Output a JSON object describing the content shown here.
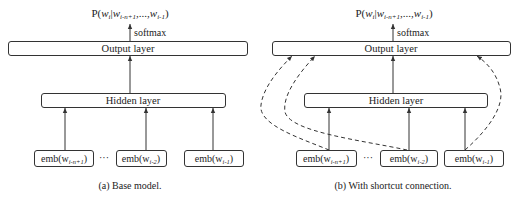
{
  "panels": [
    {
      "id": "a",
      "probability_label": "P(w",
      "prob": {
        "p": "P(",
        "wi": "w",
        "wi_sub": "i",
        "bar": "|",
        "w1": "w",
        "w1_sub": "i-n+1",
        "dots": ",...,",
        "w2": "w",
        "w2_sub": "i-1",
        "close": ")"
      },
      "softmax_label": "softmax",
      "output_layer_label": "Output layer",
      "hidden_layer_label": "Hidden layer",
      "embeddings": [
        {
          "prefix": "emb(w",
          "sub": "i-n+1",
          "suffix": ")"
        },
        {
          "prefix": "emb(w",
          "sub": "i-2",
          "suffix": ")"
        },
        {
          "prefix": "emb(w",
          "sub": "i-1",
          "suffix": ")"
        }
      ],
      "ellipsis": "···",
      "caption": "(a) Base model."
    },
    {
      "id": "b",
      "prob": {
        "p": "P(",
        "wi": "w",
        "wi_sub": "i",
        "bar": "|",
        "w1": "w",
        "w1_sub": "i-n+1",
        "dots": ",...,",
        "w2": "w",
        "w2_sub": "i-1",
        "close": ")"
      },
      "softmax_label": "softmax",
      "output_layer_label": "Output layer",
      "hidden_layer_label": "Hidden layer",
      "embeddings": [
        {
          "prefix": "emb(w",
          "sub": "i-n+1",
          "suffix": ")"
        },
        {
          "prefix": "emb(w",
          "sub": "i-2",
          "suffix": ")"
        },
        {
          "prefix": "emb(w",
          "sub": "i-1",
          "suffix": ")"
        }
      ],
      "ellipsis": "···",
      "caption": "(b) With shortcut connection.",
      "shortcut_connections": "dashed"
    }
  ]
}
